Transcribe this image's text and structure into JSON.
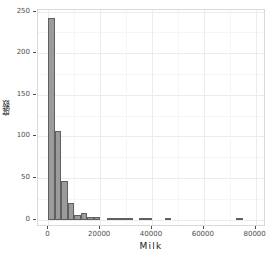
{
  "chart_data": {
    "type": "bar",
    "title": "",
    "subtitle": "",
    "xlabel": "Milk",
    "ylabel": "度数",
    "xlim": [
      -4000,
      84000
    ],
    "ylim": [
      -9,
      252
    ],
    "grid": true,
    "legend": "none",
    "binwidth": 2500,
    "bar_fill": "#9b9b9b",
    "bar_border": "#5f5f5f",
    "panel_border": "#d9d9d9",
    "grid_major_color": "#ebebeb",
    "grid_minor_color": "#f5f5f5",
    "x_ticks": [
      0,
      20000,
      40000,
      60000,
      80000
    ],
    "x_tick_labels": [
      "0",
      "20000",
      "40000",
      "60000",
      "80000"
    ],
    "y_ticks": [
      0,
      50,
      100,
      150,
      200,
      250
    ],
    "y_tick_labels": [
      "0",
      "50",
      "100",
      "150",
      "200",
      "250"
    ],
    "bins": [
      {
        "x0": 0,
        "x1": 2500,
        "value": 242
      },
      {
        "x0": 2500,
        "x1": 5000,
        "value": 106
      },
      {
        "x0": 5000,
        "x1": 7500,
        "value": 46
      },
      {
        "x0": 7500,
        "x1": 10000,
        "value": 20
      },
      {
        "x0": 10000,
        "x1": 12500,
        "value": 6
      },
      {
        "x0": 12500,
        "x1": 15000,
        "value": 8
      },
      {
        "x0": 15000,
        "x1": 17500,
        "value": 3
      },
      {
        "x0": 17500,
        "x1": 20000,
        "value": 3
      },
      {
        "x0": 20000,
        "x1": 22500,
        "value": 0
      },
      {
        "x0": 22500,
        "x1": 25000,
        "value": 2
      },
      {
        "x0": 25000,
        "x1": 27500,
        "value": 2
      },
      {
        "x0": 27500,
        "x1": 30000,
        "value": 1
      },
      {
        "x0": 30000,
        "x1": 32500,
        "value": 1
      },
      {
        "x0": 32500,
        "x1": 35000,
        "value": 0
      },
      {
        "x0": 35000,
        "x1": 37500,
        "value": 1
      },
      {
        "x0": 37500,
        "x1": 40000,
        "value": 1
      },
      {
        "x0": 40000,
        "x1": 42500,
        "value": 0
      },
      {
        "x0": 42500,
        "x1": 45000,
        "value": 0
      },
      {
        "x0": 45000,
        "x1": 47500,
        "value": 1
      },
      {
        "x0": 47500,
        "x1": 50000,
        "value": 0
      },
      {
        "x0": 50000,
        "x1": 52500,
        "value": 0
      },
      {
        "x0": 52500,
        "x1": 55000,
        "value": 0
      },
      {
        "x0": 55000,
        "x1": 57500,
        "value": 0
      },
      {
        "x0": 57500,
        "x1": 60000,
        "value": 0
      },
      {
        "x0": 60000,
        "x1": 62500,
        "value": 0
      },
      {
        "x0": 62500,
        "x1": 65000,
        "value": 0
      },
      {
        "x0": 65000,
        "x1": 67500,
        "value": 0
      },
      {
        "x0": 67500,
        "x1": 70000,
        "value": 0
      },
      {
        "x0": 70000,
        "x1": 72500,
        "value": 0
      },
      {
        "x0": 72500,
        "x1": 75000,
        "value": 1
      },
      {
        "x0": 75000,
        "x1": 77500,
        "value": 0
      }
    ]
  }
}
